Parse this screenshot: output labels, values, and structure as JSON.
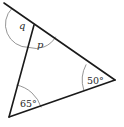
{
  "figure": {
    "type": "triangle-angle-diagram"
  },
  "angles": {
    "q": {
      "label": "q",
      "kind": "exterior"
    },
    "p": {
      "label": "p",
      "kind": "interior"
    },
    "right": {
      "label": "50°",
      "value_deg": 50
    },
    "bottom_left": {
      "label": "65°",
      "value_deg": 65
    }
  },
  "colors": {
    "line": "#1a1a1a",
    "arc": "#7a7a7a",
    "text": "#2a2a2a",
    "background": "#ffffff"
  }
}
